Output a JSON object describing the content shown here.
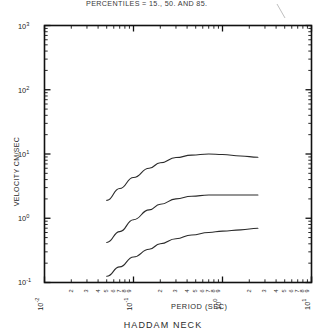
{
  "chart_data": {
    "type": "line",
    "title": "PERCENTILES =  15., 50. AND  85.",
    "xlabel": "PERIOD (SEC)",
    "ylabel": "VELOCITY CM/SEC",
    "caption": "HADDAM NECK",
    "xscale": "log",
    "yscale": "log",
    "xlim": [
      0.01,
      10
    ],
    "ylim": [
      0.1,
      1000
    ],
    "grid": false,
    "legend_position": "none",
    "x_decade_labels": [
      "10-2",
      "10-1",
      "100",
      "101"
    ],
    "x_decade_mantissa": [
      "10",
      "10",
      "10",
      "10"
    ],
    "x_decade_exponent": [
      "-2",
      "-1",
      "0",
      "1"
    ],
    "y_decade_mantissa": [
      "10",
      "10",
      "10",
      "10",
      "10"
    ],
    "y_decade_exponent": [
      "3",
      "2",
      "1",
      "0",
      "-1"
    ],
    "minor_tick_labels": [
      "2",
      "3",
      "4",
      "5",
      "6",
      "7",
      "8",
      "9"
    ],
    "series": [
      {
        "name": "85th percentile",
        "x": [
          0.05,
          0.07,
          0.1,
          0.15,
          0.2,
          0.3,
          0.45,
          0.7,
          1.0,
          1.6,
          2.5
        ],
        "y": [
          1.9,
          2.9,
          4.3,
          6.0,
          7.3,
          8.8,
          9.6,
          10.0,
          9.8,
          9.3,
          8.9
        ]
      },
      {
        "name": "50th percentile",
        "x": [
          0.05,
          0.07,
          0.1,
          0.15,
          0.2,
          0.3,
          0.45,
          0.7,
          1.0,
          1.6,
          2.5
        ],
        "y": [
          0.42,
          0.62,
          0.95,
          1.35,
          1.65,
          2.0,
          2.2,
          2.3,
          2.3,
          2.3,
          2.3
        ]
      },
      {
        "name": "15th percentile",
        "x": [
          0.05,
          0.07,
          0.1,
          0.15,
          0.2,
          0.3,
          0.45,
          0.7,
          1.0,
          1.6,
          2.5
        ],
        "y": [
          0.125,
          0.175,
          0.25,
          0.33,
          0.4,
          0.48,
          0.55,
          0.6,
          0.63,
          0.66,
          0.7
        ]
      }
    ],
    "colors": {
      "curve": "#2b2b2b",
      "frame": "#111111",
      "background": "#ffffff"
    }
  }
}
